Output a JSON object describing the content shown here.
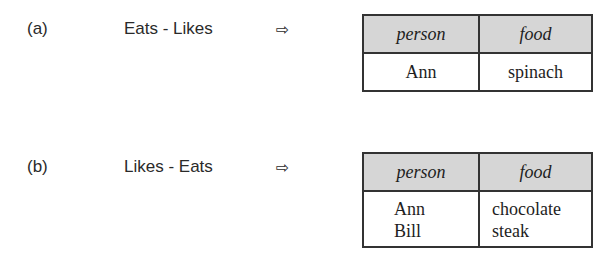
{
  "examples": [
    {
      "label": "(a)",
      "expression": "Eats - Likes",
      "arrow": "⇨",
      "result_table": {
        "columns": [
          "person",
          "food"
        ],
        "rows": [
          [
            "Ann",
            "spinach"
          ]
        ]
      }
    },
    {
      "label": "(b)",
      "expression": "Likes - Eats",
      "arrow": "⇨",
      "result_table": {
        "columns": [
          "person",
          "food"
        ],
        "rows": [
          [
            "Ann",
            "chocolate"
          ],
          [
            "Bill",
            "steak"
          ]
        ]
      }
    }
  ],
  "colors": {
    "header_bg": "#d6d6d6",
    "border": "#333333",
    "text": "#2a2a2a"
  }
}
